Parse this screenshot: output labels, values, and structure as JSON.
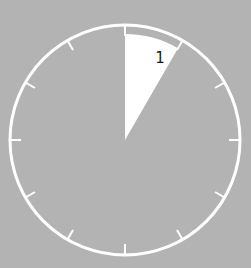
{
  "diagram": {
    "type": "clock-face-sector",
    "colors": {
      "background": "#b3b3b3",
      "outline": "#ffffff",
      "sector": "#ffffff",
      "label": "#1a1a1a"
    },
    "tick_count": 12,
    "sector": {
      "from_hour": 12,
      "to_hour": 1,
      "label": "1"
    }
  }
}
